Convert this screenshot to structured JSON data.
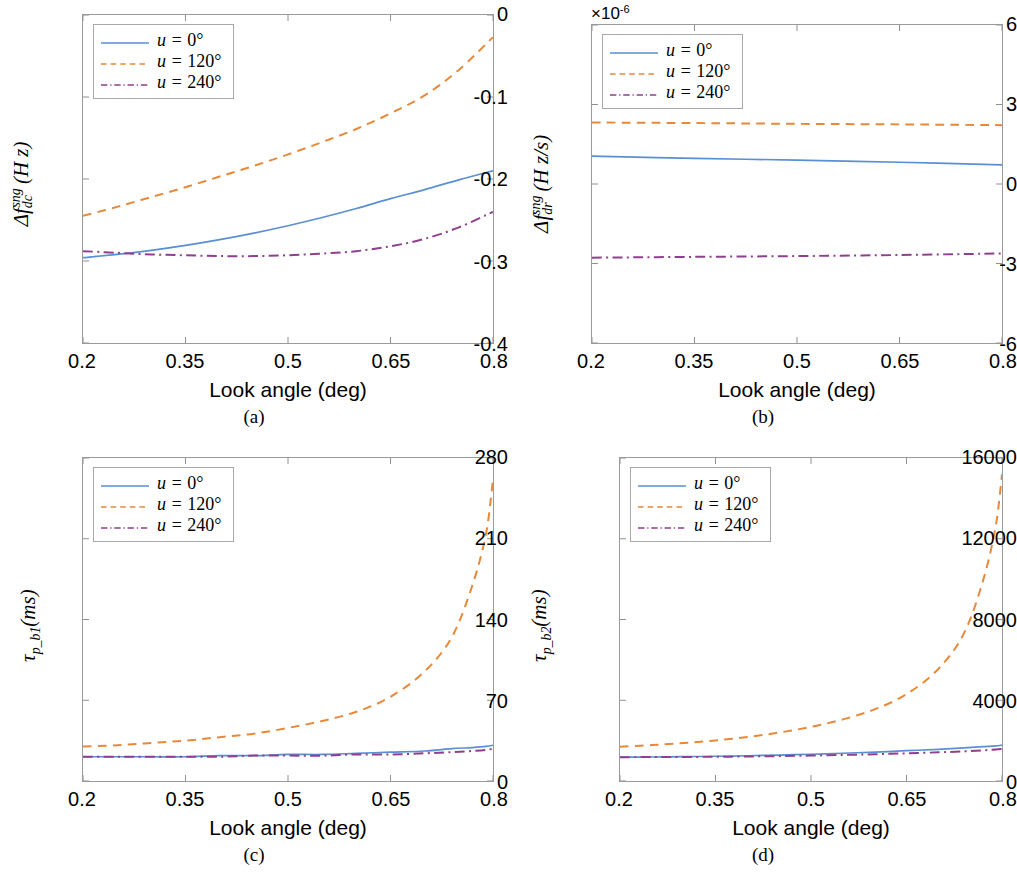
{
  "figure": {
    "xlabel": "Look angle (deg)",
    "xticks": [
      "0.2",
      "0.35",
      "0.5",
      "0.65",
      "0.8"
    ],
    "series_colors": {
      "u0": "#5a8fd4",
      "u120": "#e8893a",
      "u240": "#8e3f8e"
    },
    "legend": [
      {
        "label_var": "u",
        "label_eq": " = ",
        "label_val": "0",
        "degree": "°",
        "style": "solid",
        "color": "#5a8fd4"
      },
      {
        "label_var": "u",
        "label_eq": " = ",
        "label_val": "120",
        "degree": "°",
        "style": "dashed",
        "color": "#e8893a"
      },
      {
        "label_var": "u",
        "label_eq": " = ",
        "label_val": "240",
        "degree": "°",
        "style": "dashdot",
        "color": "#8e3f8e"
      }
    ]
  },
  "panels": {
    "a": {
      "caption": "(a)",
      "ylabel_plain": "Δf_dc^sng (Hz)",
      "yticks": [
        "0",
        "-0.1",
        "-0.2",
        "-0.3",
        "-0.4"
      ]
    },
    "b": {
      "caption": "(b)",
      "ylabel_plain": "Δf_dr^sng (Hz/s)",
      "yticks": [
        "6",
        "3",
        "0",
        "-3",
        "-6"
      ],
      "exponent_note": "×10",
      "exponent_power": "-6"
    },
    "c": {
      "caption": "(c)",
      "ylabel_plain": "τ_p_b1 (ms)",
      "yticks": [
        "280",
        "210",
        "140",
        "70",
        "0"
      ]
    },
    "d": {
      "caption": "(d)",
      "ylabel_plain": "τ_p_b2 (ms)",
      "yticks": [
        "16000",
        "12000",
        "8000",
        "4000",
        "0"
      ]
    }
  },
  "chart_data": [
    {
      "panel": "a",
      "type": "line",
      "title": "",
      "xlabel": "Look angle (deg)",
      "ylabel": "Δf_dc^{sng} (Hz)",
      "xlim": [
        0.2,
        0.8
      ],
      "ylim": [
        -0.4,
        0.0
      ],
      "xticks": [
        0.2,
        0.35,
        0.5,
        0.65,
        0.8
      ],
      "yticks": [
        0,
        -0.1,
        -0.2,
        -0.3,
        -0.4
      ],
      "grid": false,
      "legend_position": "upper left",
      "x": [
        0.2,
        0.25,
        0.3,
        0.35,
        0.4,
        0.45,
        0.5,
        0.55,
        0.6,
        0.65,
        0.7,
        0.75,
        0.8
      ],
      "series": [
        {
          "name": "u = 0°",
          "style": "solid",
          "color": "#5a8fd4",
          "values": [
            -0.296,
            -0.292,
            -0.287,
            -0.281,
            -0.274,
            -0.266,
            -0.257,
            -0.247,
            -0.236,
            -0.224,
            -0.213,
            -0.201,
            -0.19
          ]
        },
        {
          "name": "u = 120°",
          "style": "dashed",
          "color": "#e8893a",
          "values": [
            -0.245,
            -0.234,
            -0.222,
            -0.21,
            -0.197,
            -0.184,
            -0.17,
            -0.155,
            -0.139,
            -0.12,
            -0.098,
            -0.067,
            -0.027
          ]
        },
        {
          "name": "u = 240°",
          "style": "dashdot",
          "color": "#8e3f8e",
          "values": [
            -0.288,
            -0.29,
            -0.292,
            -0.293,
            -0.294,
            -0.294,
            -0.293,
            -0.291,
            -0.288,
            -0.282,
            -0.273,
            -0.259,
            -0.24
          ]
        }
      ]
    },
    {
      "panel": "b",
      "type": "line",
      "title": "",
      "xlabel": "Look angle (deg)",
      "ylabel": "Δf_dr^{sng} (Hz/s)",
      "y_scale_exponent": -6,
      "xlim": [
        0.2,
        0.8
      ],
      "ylim": [
        -6,
        6
      ],
      "xticks": [
        0.2,
        0.35,
        0.5,
        0.65,
        0.8
      ],
      "yticks": [
        6,
        3,
        0,
        -3,
        -6
      ],
      "grid": false,
      "legend_position": "upper left",
      "x": [
        0.2,
        0.35,
        0.5,
        0.65,
        0.8
      ],
      "series": [
        {
          "name": "u = 0°",
          "style": "solid",
          "color": "#5a8fd4",
          "values": [
            1.05,
            0.97,
            0.9,
            0.82,
            0.72
          ]
        },
        {
          "name": "u = 120°",
          "style": "dashed",
          "color": "#e8893a",
          "values": [
            2.32,
            2.3,
            2.27,
            2.25,
            2.22
          ]
        },
        {
          "name": "u = 240°",
          "style": "dashdot",
          "color": "#8e3f8e",
          "values": [
            -2.78,
            -2.75,
            -2.72,
            -2.68,
            -2.62
          ]
        }
      ]
    },
    {
      "panel": "c",
      "type": "line",
      "title": "",
      "xlabel": "Look angle (deg)",
      "ylabel": "τ_{p_b1}(ms)",
      "xlim": [
        0.2,
        0.8
      ],
      "ylim": [
        0,
        280
      ],
      "xticks": [
        0.2,
        0.35,
        0.5,
        0.65,
        0.8
      ],
      "yticks": [
        0,
        70,
        140,
        210,
        280
      ],
      "grid": false,
      "legend_position": "upper left",
      "x": [
        0.2,
        0.25,
        0.3,
        0.35,
        0.4,
        0.45,
        0.5,
        0.55,
        0.6,
        0.65,
        0.7,
        0.74,
        0.77,
        0.79,
        0.8
      ],
      "series": [
        {
          "name": "u = 0°",
          "style": "solid",
          "color": "#5a8fd4",
          "values": [
            21,
            21,
            21,
            21,
            22,
            22,
            23,
            23,
            24,
            25,
            26,
            28,
            29,
            30,
            31
          ]
        },
        {
          "name": "u = 120°",
          "style": "dashed",
          "color": "#e8893a",
          "values": [
            30,
            31,
            33,
            35,
            38,
            41,
            46,
            52,
            60,
            73,
            95,
            125,
            170,
            215,
            262
          ]
        },
        {
          "name": "u = 240°",
          "style": "dashdot",
          "color": "#8e3f8e",
          "values": [
            21,
            21,
            21,
            21,
            21,
            22,
            22,
            22,
            23,
            23,
            24,
            25,
            26,
            27,
            28
          ]
        }
      ]
    },
    {
      "panel": "d",
      "type": "line",
      "title": "",
      "xlabel": "Look angle (deg)",
      "ylabel": "τ_{p_b2}(ms)",
      "xlim": [
        0.2,
        0.8
      ],
      "ylim": [
        0,
        16000
      ],
      "xticks": [
        0.2,
        0.35,
        0.5,
        0.65,
        0.8
      ],
      "yticks": [
        0,
        4000,
        8000,
        12000,
        16000
      ],
      "grid": false,
      "legend_position": "upper left",
      "x": [
        0.2,
        0.25,
        0.3,
        0.35,
        0.4,
        0.45,
        0.5,
        0.55,
        0.6,
        0.65,
        0.7,
        0.74,
        0.77,
        0.79,
        0.8
      ],
      "series": [
        {
          "name": "u = 0°",
          "style": "solid",
          "color": "#5a8fd4",
          "values": [
            1180,
            1190,
            1205,
            1225,
            1250,
            1285,
            1325,
            1375,
            1430,
            1500,
            1570,
            1640,
            1700,
            1740,
            1780
          ]
        },
        {
          "name": "u = 120°",
          "style": "dashed",
          "color": "#e8893a",
          "values": [
            1700,
            1780,
            1880,
            2010,
            2180,
            2400,
            2680,
            3050,
            3550,
            4300,
            5550,
            7300,
            9900,
            12600,
            15200
          ]
        },
        {
          "name": "u = 240°",
          "style": "dashdot",
          "color": "#8e3f8e",
          "values": [
            1180,
            1185,
            1190,
            1200,
            1215,
            1235,
            1260,
            1290,
            1325,
            1370,
            1420,
            1470,
            1520,
            1555,
            1590
          ]
        }
      ]
    }
  ]
}
